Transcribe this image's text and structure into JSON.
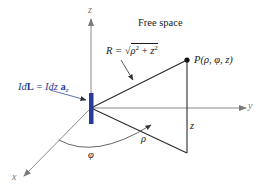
{
  "diagram": {
    "title": "Free space",
    "axes": {
      "x_label": "x",
      "y_label": "y",
      "z_label": "z"
    },
    "current_element": {
      "label_lhs": "Id",
      "label_vec": "L",
      "label_eq": " = ",
      "label_rhs": "Idz ",
      "label_unit": "a",
      "label_unit_sub": "z",
      "color": "#2a3a9a"
    },
    "distance": {
      "label_prefix": "R = ",
      "label_sqrt": "√",
      "label_rho": "ρ",
      "label_sq1": "2",
      "label_plus": " + ",
      "label_z": "z",
      "label_sq2": "2"
    },
    "point": {
      "label": "P(ρ, φ, z)"
    },
    "segments": {
      "rho_label": "ρ",
      "z_label": "z",
      "phi_label": "φ"
    },
    "colors": {
      "axis": "#8a8a8a",
      "line": "#2a2a2a",
      "element": "#2a3a9a",
      "point": "#111111"
    }
  }
}
